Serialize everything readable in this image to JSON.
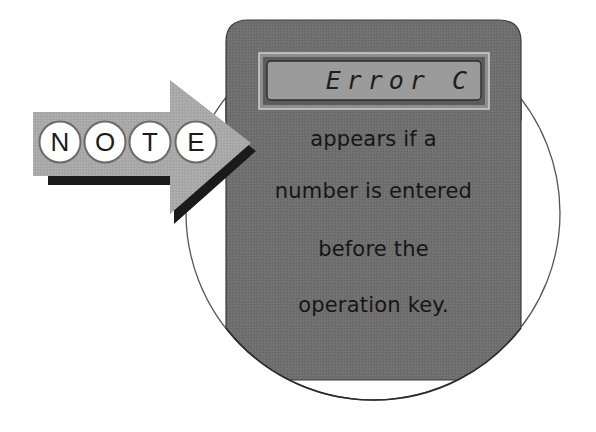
{
  "note_badge": {
    "letters": [
      "N",
      "O",
      "T",
      "E"
    ]
  },
  "display": {
    "text": "Error C"
  },
  "message": {
    "lines": [
      "appears if a",
      "number is entered",
      "before the",
      "operation key."
    ]
  },
  "colors": {
    "panel": "#6e6e6e",
    "panel_border": "#3a3a3a",
    "lcd_outer": "#8c8c8c",
    "lcd_screen": "#9a9a9a",
    "arrow": "#a7a7a7",
    "arrow_shadow": "#1a1a1a",
    "circle_outline": "#555555"
  }
}
